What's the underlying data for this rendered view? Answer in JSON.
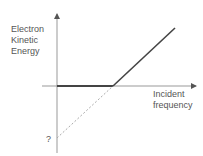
{
  "diagram": {
    "y_label_lines": [
      "Electron",
      "Kinetic",
      "Energy"
    ],
    "x_label_lines": [
      "Incident",
      "frequency"
    ],
    "intercept_label": "?"
  },
  "colors": {
    "axis": "#888888",
    "line": "#444444",
    "dashed": "#999999",
    "text": "#555555"
  }
}
